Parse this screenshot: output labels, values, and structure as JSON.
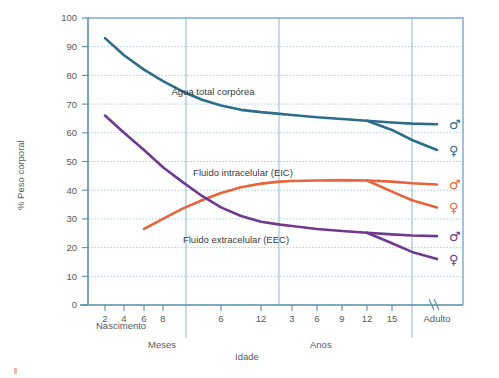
{
  "chart_data": {
    "type": "line",
    "title": "",
    "xlabel": "Idade",
    "ylabel": "% Peso corporal",
    "ylim": [
      0,
      100
    ],
    "ytick_values": [
      0,
      10,
      20,
      30,
      40,
      50,
      60,
      70,
      80,
      90,
      100
    ],
    "ytick_labels": [
      "0",
      "10",
      "20",
      "30",
      "40",
      "50",
      "60",
      "70",
      "80",
      "90",
      "100"
    ],
    "grid": true,
    "legend_position": "inline-annotations",
    "x_axis_segments": [
      {
        "name": "Nascimento",
        "label": "Nascimento"
      },
      {
        "name": "Meses",
        "label": "Meses"
      },
      {
        "name": "Anos",
        "label": "Anos"
      },
      {
        "name": "Adulto",
        "label": "Adulto"
      }
    ],
    "xtick_labels": [
      "2",
      "4",
      "6",
      "8",
      "6",
      "12",
      "3",
      "6",
      "9",
      "12",
      "15",
      "Adulto"
    ],
    "xtick_positions": [
      105,
      124,
      144,
      163,
      221,
      261,
      292,
      317,
      342,
      367,
      392,
      437
    ],
    "annotations": [
      {
        "text": "Água total corpórea",
        "x": 213,
        "y": 95
      },
      {
        "text": "Fluido intracelular (EIC)",
        "x": 243,
        "y": 176
      },
      {
        "text": "Fluido extracelular (EEC)",
        "x": 236,
        "y": 243
      }
    ],
    "series": [
      {
        "name": "Água total corpórea — masculino",
        "label": "Água total corpórea",
        "sex": "male",
        "sex_symbol": "♂",
        "color": "#2e6c8c",
        "end_value": 63,
        "points_pct": [
          [
            105,
            93
          ],
          [
            124,
            87
          ],
          [
            144,
            82
          ],
          [
            163,
            78
          ],
          [
            182,
            74.5
          ],
          [
            202,
            71.5
          ],
          [
            221,
            69.5
          ],
          [
            241,
            68
          ],
          [
            261,
            67.2
          ],
          [
            280,
            66.6
          ],
          [
            292,
            66.2
          ],
          [
            317,
            65.4
          ],
          [
            342,
            64.8
          ],
          [
            367,
            64.2
          ],
          [
            392,
            63.6
          ],
          [
            412,
            63.2
          ],
          [
            437,
            63
          ]
        ]
      },
      {
        "name": "Água total corpórea — feminino",
        "label": "Água total corpórea",
        "sex": "female",
        "sex_symbol": "♀",
        "color": "#2e6c8c",
        "end_value": 54,
        "points_pct": [
          [
            367,
            64.2
          ],
          [
            392,
            61
          ],
          [
            412,
            57.5
          ],
          [
            437,
            54
          ]
        ]
      },
      {
        "name": "Fluido intracelular (EIC) — masculino",
        "label": "Fluido intracelular (EIC)",
        "sex": "male",
        "sex_symbol": "♂",
        "color": "#e8643c",
        "end_value": 42,
        "points_pct": [
          [
            144,
            26.5
          ],
          [
            163,
            30
          ],
          [
            182,
            33.5
          ],
          [
            202,
            36.5
          ],
          [
            221,
            39
          ],
          [
            241,
            41
          ],
          [
            261,
            42.3
          ],
          [
            280,
            43
          ],
          [
            292,
            43.2
          ],
          [
            317,
            43.4
          ],
          [
            342,
            43.5
          ],
          [
            367,
            43.4
          ],
          [
            392,
            43
          ],
          [
            412,
            42.4
          ],
          [
            437,
            42
          ]
        ]
      },
      {
        "name": "Fluido intracelular (EIC) — feminino",
        "label": "Fluido intracelular (EIC)",
        "sex": "female",
        "sex_symbol": "♀",
        "color": "#e8643c",
        "end_value": 34,
        "points_pct": [
          [
            367,
            43.4
          ],
          [
            392,
            39.5
          ],
          [
            412,
            36.5
          ],
          [
            437,
            34
          ]
        ]
      },
      {
        "name": "Fluido extracelular (EEC) — masculino",
        "label": "Fluido extracelular (EEC)",
        "sex": "male",
        "sex_symbol": "♂",
        "color": "#70398f",
        "end_value": 24,
        "points_pct": [
          [
            105,
            66
          ],
          [
            124,
            60
          ],
          [
            144,
            54
          ],
          [
            163,
            48
          ],
          [
            182,
            43
          ],
          [
            202,
            38
          ],
          [
            221,
            34
          ],
          [
            241,
            31
          ],
          [
            261,
            29
          ],
          [
            280,
            28
          ],
          [
            292,
            27.5
          ],
          [
            317,
            26.5
          ],
          [
            342,
            25.8
          ],
          [
            367,
            25.2
          ],
          [
            392,
            24.6
          ],
          [
            412,
            24.2
          ],
          [
            437,
            24
          ]
        ]
      },
      {
        "name": "Fluido extracelular (EEC) — feminino",
        "label": "Fluido extracelular (EEC)",
        "sex": "female",
        "sex_symbol": "♀",
        "color": "#70398f",
        "end_value": 16,
        "points_pct": [
          [
            367,
            25.2
          ],
          [
            392,
            21.5
          ],
          [
            412,
            18.5
          ],
          [
            437,
            16
          ]
        ]
      }
    ]
  },
  "axes": {
    "y_title": "% Peso corporal",
    "x_title": "Idade",
    "y_ticks": [
      "100",
      "90",
      "80",
      "70",
      "60",
      "50",
      "40",
      "30",
      "20",
      "10",
      "0"
    ],
    "x_ticks_months_first": [
      "2",
      "4",
      "6",
      "8"
    ],
    "x_ticks_months_second": [
      "6",
      "12"
    ],
    "x_ticks_years": [
      "3",
      "6",
      "9",
      "12",
      "15"
    ],
    "x_tick_adult": "Adulto",
    "segment_birth": "Nascimento",
    "segment_months": "Meses",
    "segment_years": "Anos"
  },
  "colors": {
    "total_body_water": "#2e6c8c",
    "intracellular": "#e8643c",
    "extracellular": "#70398f",
    "axis": "#5b8fae",
    "grid": "#aac8e0",
    "plot_border": "#7fa9c4",
    "text": "#58595b"
  },
  "symbols": {
    "male": "♂",
    "female": "♀",
    "axis_break": "//"
  }
}
